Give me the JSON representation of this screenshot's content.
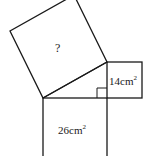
{
  "figure": {
    "type": "pythagorean-squares",
    "line_color": "#1a1a1a",
    "background": "#ffffff",
    "labels": {
      "hypotenuse_square": "?",
      "small_square_value": "14",
      "small_square_unit": "cm",
      "small_square_exp": "2",
      "bottom_square_value": "26",
      "bottom_square_unit": "cm",
      "bottom_square_exp": "2"
    }
  }
}
